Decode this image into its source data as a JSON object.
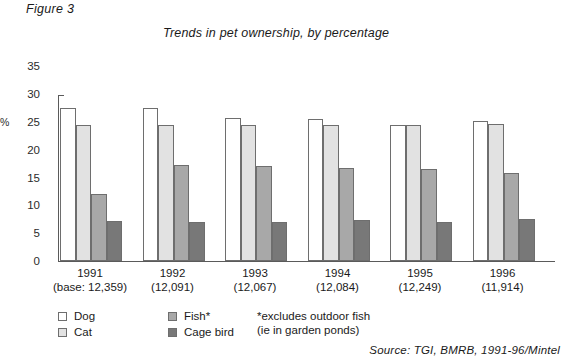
{
  "figure_label": "Figure 3",
  "title": "Trends in pet ownership, by percentage",
  "axis": {
    "y_title": "%",
    "y_ticks": [
      "35",
      "30",
      "25",
      "20",
      "15",
      "10",
      "5",
      "0"
    ]
  },
  "legend": {
    "items": [
      {
        "label": "Dog",
        "color": "#ffffff"
      },
      {
        "label": "Cat",
        "color": "#e2e2e2"
      },
      {
        "label": "Fish*",
        "color": "#a8a8a8"
      },
      {
        "label": "Cage bird",
        "color": "#787878"
      }
    ]
  },
  "footnote": {
    "line1": "*excludes outdoor fish",
    "line2": "(ie in garden ponds)"
  },
  "source": "Source: TGI, BMRB, 1991-96/Mintel",
  "x_labels": [
    {
      "year": "1991",
      "base": "(base: 12,359)"
    },
    {
      "year": "1992",
      "base": "(12,091)"
    },
    {
      "year": "1993",
      "base": "(12,067)"
    },
    {
      "year": "1994",
      "base": "(12,084)"
    },
    {
      "year": "1995",
      "base": "(12,249)"
    },
    {
      "year": "1996",
      "base": "(11,914)"
    }
  ],
  "chart_data": {
    "type": "bar",
    "title": "Trends in pet ownership, by percentage",
    "xlabel": "",
    "ylabel": "%",
    "ylim": [
      0,
      35
    ],
    "ytick_step": 5,
    "grid": false,
    "legend_position": "bottom-left",
    "categories": [
      "1991",
      "1992",
      "1993",
      "1994",
      "1995",
      "1996"
    ],
    "category_bases": [
      "12,359",
      "12,091",
      "12,067",
      "12,084",
      "12,249",
      "11,914"
    ],
    "series": [
      {
        "name": "Dog",
        "color": "#ffffff",
        "values": [
          27.5,
          27.5,
          25.7,
          25.5,
          24.5,
          25.2
        ]
      },
      {
        "name": "Cat",
        "color": "#e2e2e2",
        "values": [
          24.4,
          24.5,
          24.4,
          24.4,
          24.5,
          24.6
        ]
      },
      {
        "name": "Fish*",
        "color": "#a8a8a8",
        "values": [
          12.1,
          17.3,
          17.0,
          16.7,
          16.5,
          15.8
        ]
      },
      {
        "name": "Cage bird",
        "color": "#787878",
        "values": [
          7.1,
          7.0,
          7.0,
          7.3,
          7.0,
          7.6
        ]
      }
    ],
    "annotations": [
      "*excludes outdoor fish (ie in garden ponds)"
    ]
  }
}
